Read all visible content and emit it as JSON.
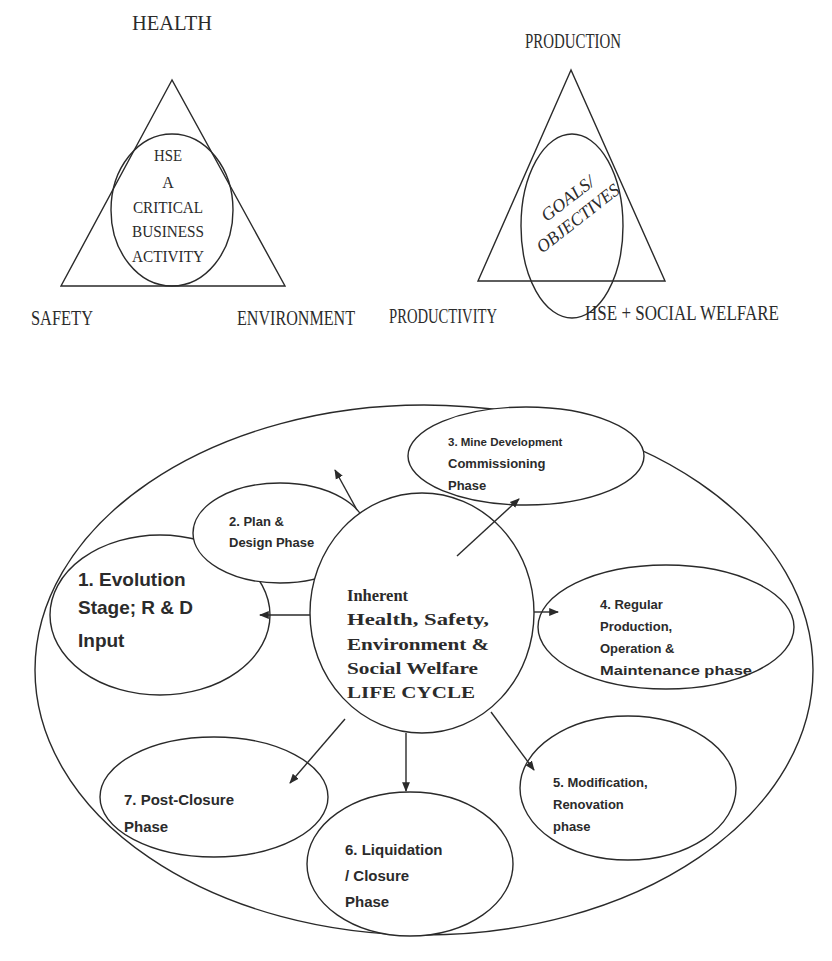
{
  "figure_left": {
    "title": "HSE triangle",
    "vertices": {
      "top": "HEALTH",
      "bottom_left": "SAFETY",
      "bottom_right": "ENVIRONMENT"
    },
    "center_lines": [
      "HSE",
      "A",
      "CRITICAL",
      "BUSINESS",
      "ACTIVITY"
    ]
  },
  "figure_right": {
    "title": "Production triangle",
    "vertices": {
      "top": "PRODUCTION",
      "bottom_left": "PRODUCTIVITY",
      "bottom_right": "HSE + SOCIAL WELFARE"
    },
    "center_lines": [
      "GOALS/",
      "OBJECTIVES"
    ]
  },
  "lifecycle": {
    "center_lines": [
      "Inherent",
      "Health, Safety,",
      "Environment &",
      "Social Welfare",
      "LIFE CYCLE"
    ],
    "phases": [
      {
        "id": 1,
        "lines": [
          "1. Evolution",
          "Stage; R & D",
          "Input"
        ]
      },
      {
        "id": 2,
        "lines": [
          "2. Plan &",
          "Design Phase"
        ]
      },
      {
        "id": 3,
        "lines": [
          "3. Mine Development",
          "Commissioning",
          "Phase"
        ]
      },
      {
        "id": 4,
        "lines": [
          "4. Regular",
          "Production,",
          "Operation &",
          "Maintenance phase"
        ]
      },
      {
        "id": 5,
        "lines": [
          "5. Modification,",
          "Renovation",
          "phase"
        ]
      },
      {
        "id": 6,
        "lines": [
          "6. Liquidation",
          "/ Closure",
          "Phase"
        ]
      },
      {
        "id": 7,
        "lines": [
          "7. Post-Closure",
          "Phase"
        ]
      }
    ]
  },
  "colors": {
    "line": "#2a2a2a",
    "text": "#2b2b2b",
    "background": "#ffffff"
  }
}
